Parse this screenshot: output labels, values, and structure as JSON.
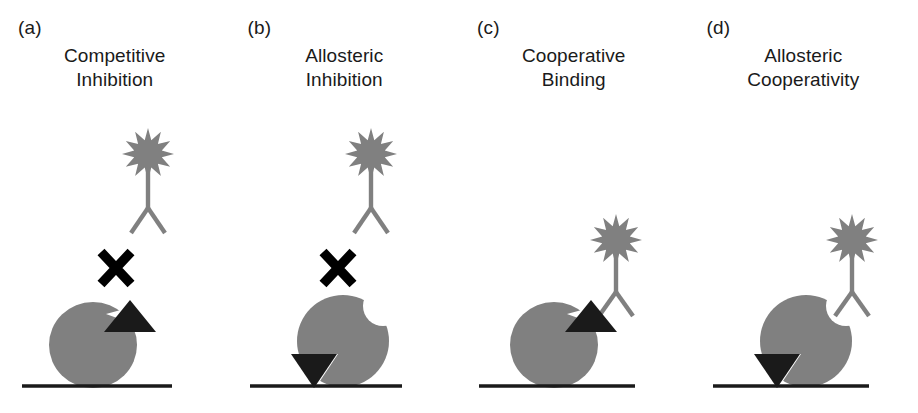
{
  "figure": {
    "kind": "scientific-schematic",
    "caption_present": false,
    "background_color": "#ffffff",
    "colors": {
      "blob_gray": "#808080",
      "antibody_gray": "#808080",
      "star_gray": "#808080",
      "triangle_black": "#1a1a1a",
      "baseline_black": "#1a1a1a",
      "x_mark_black": "#000000",
      "text_black": "#1a1a1a"
    }
  },
  "panels": [
    {
      "letter": "(a)",
      "title_line1": "Competitive",
      "title_line2": "Inhibition",
      "has_x_mark": true,
      "x_mark": "✕",
      "antibody_bound": false,
      "blob_shape": "ellipse-with-triangular-notch-upper-right",
      "notch_upper_right": "triangular",
      "notch_lower_left": "none",
      "triangle_upper_right": "up-triangle-dark",
      "triangle_lower_left": "none",
      "baseline": true
    },
    {
      "letter": "(b)",
      "title_line1": "Allosteric",
      "title_line2": "Inhibition",
      "has_x_mark": true,
      "x_mark": "✕",
      "antibody_bound": false,
      "blob_shape": "ellipse-with-round-bite-upper-right-and-notch-lower-left",
      "notch_upper_right": "round-bite",
      "notch_lower_left": "triangular",
      "triangle_upper_right": "none",
      "triangle_lower_left": "down-triangle-dark",
      "baseline": true
    },
    {
      "letter": "(c)",
      "title_line1": "Cooperative",
      "title_line2": "Binding",
      "has_x_mark": false,
      "x_mark": "",
      "antibody_bound": true,
      "blob_shape": "ellipse-with-triangular-notch-upper-right",
      "notch_upper_right": "triangular",
      "notch_lower_left": "none",
      "triangle_upper_right": "up-triangle-dark",
      "triangle_lower_left": "none",
      "baseline": true
    },
    {
      "letter": "(d)",
      "title_line1": "Allosteric",
      "title_line2": "Cooperativity",
      "has_x_mark": false,
      "x_mark": "",
      "antibody_bound": true,
      "blob_shape": "ellipse-with-round-bite-upper-right-and-notch-lower-left",
      "notch_upper_right": "round-bite",
      "notch_lower_left": "triangular",
      "triangle_upper_right": "none",
      "triangle_lower_left": "down-triangle-dark",
      "baseline": true
    }
  ],
  "legend_elements": {
    "star": "labeled-probe-star",
    "antibody": "y-shaped-antibody",
    "blob": "receptor-protein-blob",
    "triangle": "ligand-triangle",
    "baseline": "surface-line",
    "x_mark": "blocked-interaction-x"
  }
}
